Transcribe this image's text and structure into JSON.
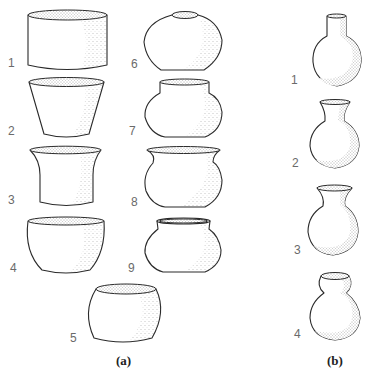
{
  "figure": {
    "panels": [
      {
        "id": "a",
        "label": "(a)",
        "vessels": [
          {
            "number": "1",
            "form": "cylindrical jar"
          },
          {
            "number": "2",
            "form": "flared conical bowl"
          },
          {
            "number": "3",
            "form": "concave-sided flared beaker"
          },
          {
            "number": "4",
            "form": "deep rounded bowl"
          },
          {
            "number": "5",
            "form": "barrel-shaped restricted bowl"
          },
          {
            "number": "6",
            "form": "neckless globular jar (seed jar)"
          },
          {
            "number": "7",
            "form": "short-necked globular jar"
          },
          {
            "number": "8",
            "form": "everted-rim globular jar"
          },
          {
            "number": "9",
            "form": "collared globular jar"
          }
        ]
      },
      {
        "id": "b",
        "label": "(b)",
        "vessels": [
          {
            "number": "1",
            "form": "straight-necked bottle"
          },
          {
            "number": "2",
            "form": "flared-neck bottle"
          },
          {
            "number": "3",
            "form": "wide flared-neck bottle"
          },
          {
            "number": "4",
            "form": "double-gourd bottle"
          }
        ]
      }
    ],
    "colors": {
      "line": "#2a2a2a",
      "stipple": "#555555",
      "number_text": "#6a6a6a",
      "panel_text": "#222222",
      "background": "#ffffff"
    }
  }
}
